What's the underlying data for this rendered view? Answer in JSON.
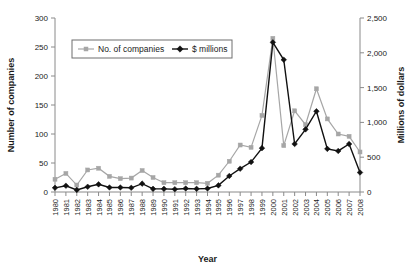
{
  "chart_data": {
    "type": "line",
    "title": "",
    "xlabel": "Year",
    "ylabel": "Number of companies",
    "y2label": "Millions of dollars",
    "grid": false,
    "legend_position": "top-left-inside",
    "ylim": [
      0,
      300
    ],
    "y2lim": [
      0,
      2500
    ],
    "yticks": [
      0,
      50,
      100,
      150,
      200,
      250,
      300
    ],
    "ytick_labels": [
      "0",
      "50",
      "100",
      "150",
      "200",
      "250",
      "300"
    ],
    "y2ticks": [
      0,
      500,
      1000,
      1500,
      2000,
      2500
    ],
    "y2tick_labels": [
      "0",
      "500",
      "1,000",
      "1,500",
      "2,000",
      "2,500"
    ],
    "categories": [
      "1980",
      "1981",
      "1982",
      "1983",
      "1984",
      "1985",
      "1986",
      "1987",
      "1988",
      "1989",
      "1990",
      "1991",
      "1992",
      "1993",
      "1994",
      "1995",
      "1996",
      "1997",
      "1998",
      "1999",
      "2000",
      "2001",
      "2002",
      "2003",
      "2004",
      "2005",
      "2006",
      "2007",
      "2008"
    ],
    "series": [
      {
        "name": "No. of companies",
        "axis": "left",
        "color": "#a6a6a6",
        "marker": "square",
        "values": [
          22,
          32,
          12,
          38,
          41,
          27,
          23,
          24,
          37,
          25,
          16,
          16,
          16,
          16,
          15,
          29,
          53,
          81,
          77,
          132,
          265,
          80,
          140,
          116,
          178,
          126,
          100,
          96,
          69
        ]
      },
      {
        "name": "$ millions",
        "axis": "right",
        "color": "#111111",
        "marker": "diamond",
        "values": [
          60,
          90,
          30,
          75,
          110,
          65,
          65,
          60,
          120,
          45,
          45,
          40,
          50,
          45,
          50,
          95,
          230,
          335,
          430,
          630,
          2150,
          1900,
          690,
          900,
          1160,
          620,
          590,
          690,
          280
        ]
      }
    ]
  }
}
